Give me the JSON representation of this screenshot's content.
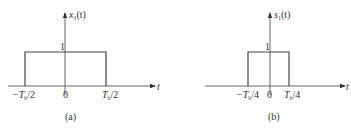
{
  "panels": [
    {
      "id": "a",
      "caption": "(a)",
      "signal_label": "x",
      "signal_sub": "1",
      "signal_arg": "(t)",
      "amplitude_label": "1",
      "time_axis_label": "t",
      "tick_labels": {
        "left": "−T",
        "left_sub": "b",
        "left_frac": "/2",
        "zero": "0",
        "right": "T",
        "right_sub": "b",
        "right_frac": "/2"
      },
      "pulse": {
        "start": "-Tb/2",
        "end": "Tb/2",
        "amplitude": 1
      }
    },
    {
      "id": "b",
      "caption": "(b)",
      "signal_label": "s",
      "signal_sub": "1",
      "signal_arg": "(t)",
      "amplitude_label": "1",
      "time_axis_label": "t",
      "tick_labels": {
        "left": "−T",
        "left_sub": "b",
        "left_frac": "/4",
        "zero": "0",
        "right": "T",
        "right_sub": "b",
        "right_frac": "/4"
      },
      "pulse": {
        "start": "-Tb/4",
        "end": "Tb/4",
        "amplitude": 1
      }
    }
  ]
}
